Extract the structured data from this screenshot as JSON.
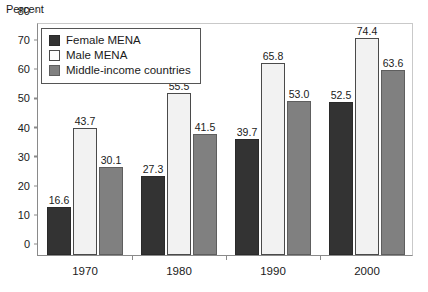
{
  "chart_data": {
    "type": "bar",
    "title": "",
    "subtitle": "",
    "xlabel": "",
    "ylabel": "Percent",
    "categories": [
      "1970",
      "1980",
      "1990",
      "2000"
    ],
    "series": [
      {
        "name": "Female MENA",
        "color": "#333333",
        "values": [
          16.6,
          27.3,
          39.7,
          52.5
        ],
        "labels": [
          "16.6",
          "27.3",
          "39.7",
          "52.5"
        ]
      },
      {
        "name": "Male MENA",
        "color": "#f2f2f2",
        "values": [
          43.7,
          55.5,
          65.8,
          74.4
        ],
        "labels": [
          "43.7",
          "55.5",
          "65.8",
          "74.4"
        ]
      },
      {
        "name": "Middle-income countries",
        "color": "#808080",
        "values": [
          30.1,
          41.5,
          53.0,
          63.6
        ],
        "labels": [
          "30.1",
          "41.5",
          "53.0",
          "63.6"
        ]
      }
    ],
    "ylim": [
      0,
      80
    ],
    "yticks": [
      0,
      10,
      20,
      30,
      40,
      50,
      60,
      70,
      80
    ],
    "ytick_labels": [
      "0",
      "10",
      "20",
      "30",
      "40",
      "50",
      "60",
      "70",
      "80"
    ],
    "grid": false,
    "legend_position": "top-left",
    "data_labels": true
  },
  "axis": {
    "y_title": "Percent"
  },
  "legend": {
    "entries": [
      {
        "label": "Female MENA"
      },
      {
        "label": "Male MENA"
      },
      {
        "label": "Middle-income countries"
      }
    ]
  }
}
